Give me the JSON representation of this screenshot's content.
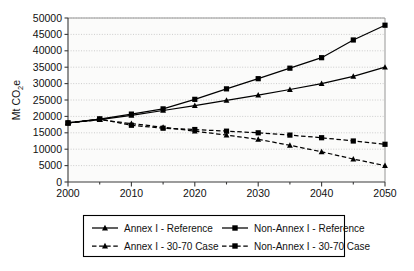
{
  "chart_data": {
    "type": "line",
    "title": "",
    "xlabel": "",
    "ylabel": "Mt CO2e",
    "ylabel_parts": {
      "prefix": "Mt CO",
      "sub": "2",
      "suffix": "e"
    },
    "x": [
      2000,
      2005,
      2010,
      2015,
      2020,
      2025,
      2030,
      2035,
      2040,
      2045,
      2050
    ],
    "xlim": [
      2000,
      2050
    ],
    "ylim": [
      0,
      50000
    ],
    "xticks": [
      "2000",
      "2010",
      "2020",
      "2030",
      "2040",
      "2050"
    ],
    "xtick_values": [
      2000,
      2010,
      2020,
      2030,
      2040,
      2050
    ],
    "yticks": [
      "0",
      "5000",
      "10000",
      "15000",
      "20000",
      "25000",
      "30000",
      "35000",
      "40000",
      "45000",
      "50000"
    ],
    "ytick_values": [
      0,
      5000,
      10000,
      15000,
      20000,
      25000,
      30000,
      35000,
      40000,
      45000,
      50000
    ],
    "grid": true,
    "grid_style": "dotted-horizontal",
    "legend_position": "bottom",
    "series": [
      {
        "name": "Annex I - Reference",
        "marker": "triangle",
        "line_style": "solid",
        "color": "#000000",
        "values": [
          18000,
          19000,
          20300,
          21800,
          23300,
          24900,
          26500,
          28200,
          30000,
          32200,
          35000
        ]
      },
      {
        "name": "Non-Annex I - Reference",
        "marker": "square",
        "line_style": "solid",
        "color": "#000000",
        "values": [
          18000,
          19200,
          20700,
          22300,
          25200,
          28400,
          31500,
          34700,
          37900,
          43300,
          47800
        ]
      },
      {
        "name": "Annex I - 30-70 Case",
        "marker": "triangle",
        "line_style": "dashed",
        "color": "#000000",
        "values": [
          18000,
          19000,
          17800,
          16700,
          15500,
          14300,
          13000,
          11200,
          9200,
          7000,
          5000
        ]
      },
      {
        "name": "Non-Annex I - 30-70 Case",
        "marker": "square",
        "line_style": "dashed",
        "color": "#000000",
        "values": [
          18000,
          19200,
          17300,
          16400,
          16000,
          15500,
          15000,
          14300,
          13500,
          12500,
          11500
        ]
      }
    ]
  },
  "legend": {
    "entries": [
      {
        "label": "Annex I - Reference",
        "marker": "triangle",
        "line_style": "solid"
      },
      {
        "label": "Non-Annex I - Reference",
        "marker": "square",
        "line_style": "solid"
      },
      {
        "label": "Annex I - 30-70 Case",
        "marker": "triangle",
        "line_style": "dashed"
      },
      {
        "label": "Non-Annex I - 30-70 Case",
        "marker": "square",
        "line_style": "dashed"
      }
    ]
  },
  "colors": {
    "series": "#000000",
    "grid": "#b9b9b9",
    "axis": "#3a3a3a",
    "plot_background": "#fbfbfa",
    "page_background": "#ffffff"
  }
}
